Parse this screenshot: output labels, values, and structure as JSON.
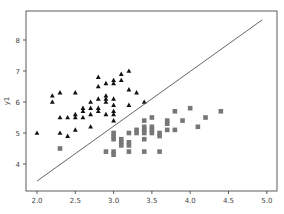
{
  "chart_data": {
    "type": "scatter",
    "title": "",
    "xlabel": "",
    "ylabel": "y1",
    "xlim": [
      1.85,
      5.05
    ],
    "ylim": [
      3.2,
      8.8
    ],
    "xticks": [
      "2.0",
      "2.5",
      "3.0",
      "3.5",
      "4.0",
      "4.5",
      "5.0"
    ],
    "yticks": [
      "4",
      "5",
      "6",
      "7",
      "8"
    ],
    "grid": false,
    "legend": null,
    "series": [
      {
        "name": "class A",
        "marker": "triangle",
        "color": "#111111",
        "points": [
          [
            2.0,
            5.0
          ],
          [
            2.2,
            6.2
          ],
          [
            2.2,
            6.0
          ],
          [
            2.3,
            6.3
          ],
          [
            2.5,
            6.3
          ],
          [
            2.3,
            5.5
          ],
          [
            2.4,
            5.5
          ],
          [
            2.5,
            5.5
          ],
          [
            2.5,
            5.6
          ],
          [
            2.3,
            5.0
          ],
          [
            2.4,
            4.9
          ],
          [
            2.5,
            5.1
          ],
          [
            2.6,
            5.7
          ],
          [
            2.6,
            5.8
          ],
          [
            2.6,
            5.5
          ],
          [
            2.7,
            5.8
          ],
          [
            2.7,
            5.6
          ],
          [
            2.7,
            5.2
          ],
          [
            2.7,
            6.0
          ],
          [
            2.8,
            6.1
          ],
          [
            2.8,
            5.8
          ],
          [
            2.8,
            5.7
          ],
          [
            2.8,
            6.5
          ],
          [
            2.8,
            6.8
          ],
          [
            2.9,
            6.0
          ],
          [
            2.9,
            6.2
          ],
          [
            2.9,
            6.6
          ],
          [
            2.9,
            5.6
          ],
          [
            2.9,
            6.1
          ],
          [
            3.0,
            6.7
          ],
          [
            3.0,
            6.6
          ],
          [
            3.0,
            6.1
          ],
          [
            3.0,
            5.9
          ],
          [
            3.0,
            5.7
          ],
          [
            3.0,
            5.6
          ],
          [
            3.0,
            5.4
          ],
          [
            3.1,
            6.7
          ],
          [
            3.1,
            6.9
          ],
          [
            3.2,
            7.0
          ],
          [
            3.2,
            6.4
          ],
          [
            3.2,
            5.9
          ],
          [
            3.3,
            6.3
          ],
          [
            3.4,
            6.0
          ]
        ]
      },
      {
        "name": "class B",
        "marker": "square",
        "color": "#777777",
        "points": [
          [
            2.3,
            4.5
          ],
          [
            2.9,
            4.4
          ],
          [
            3.0,
            4.4
          ],
          [
            3.0,
            4.3
          ],
          [
            3.0,
            4.8
          ],
          [
            3.0,
            4.9
          ],
          [
            3.0,
            5.0
          ],
          [
            3.1,
            4.6
          ],
          [
            3.1,
            4.7
          ],
          [
            3.1,
            4.8
          ],
          [
            3.2,
            4.4
          ],
          [
            3.2,
            4.6
          ],
          [
            3.2,
            4.7
          ],
          [
            3.2,
            5.0
          ],
          [
            3.3,
            5.0
          ],
          [
            3.3,
            5.1
          ],
          [
            3.4,
            4.4
          ],
          [
            3.4,
            4.8
          ],
          [
            3.4,
            5.0
          ],
          [
            3.4,
            5.1
          ],
          [
            3.4,
            5.2
          ],
          [
            3.4,
            5.4
          ],
          [
            3.5,
            5.0
          ],
          [
            3.5,
            5.1
          ],
          [
            3.5,
            5.2
          ],
          [
            3.5,
            5.5
          ],
          [
            3.6,
            4.4
          ],
          [
            3.6,
            4.9
          ],
          [
            3.6,
            5.0
          ],
          [
            3.7,
            5.1
          ],
          [
            3.7,
            5.3
          ],
          [
            3.7,
            5.4
          ],
          [
            3.8,
            5.1
          ],
          [
            3.8,
            5.7
          ],
          [
            3.9,
            5.4
          ],
          [
            4.0,
            5.8
          ],
          [
            4.1,
            5.2
          ],
          [
            4.2,
            5.5
          ],
          [
            4.4,
            5.7
          ]
        ]
      },
      {
        "name": "decision boundary",
        "marker": "line",
        "color": "#555555",
        "points": [
          [
            2.0,
            3.45
          ],
          [
            4.94,
            8.65
          ]
        ]
      }
    ]
  }
}
